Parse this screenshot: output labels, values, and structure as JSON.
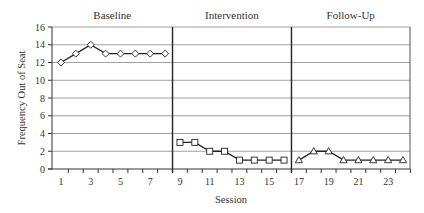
{
  "chart_data": {
    "type": "line",
    "title": "",
    "xlabel": "Session",
    "ylabel": "Frequency Out of Seat",
    "ylim": [
      0,
      16
    ],
    "yticks": [
      0,
      2,
      4,
      6,
      8,
      10,
      12,
      14,
      16
    ],
    "xlim": [
      1,
      24
    ],
    "xtick_labels": [
      1,
      3,
      5,
      7,
      9,
      11,
      13,
      15,
      17,
      19,
      21,
      23
    ],
    "grid": "horizontal",
    "legend": "none",
    "phase_change_lines": [
      8.5,
      16.5
    ],
    "phases": [
      {
        "name": "Baseline",
        "marker": "diamond",
        "x": [
          1,
          2,
          3,
          4,
          5,
          6,
          7,
          8
        ],
        "values": [
          12,
          13,
          14,
          13,
          13,
          13,
          13,
          13
        ]
      },
      {
        "name": "Intervention",
        "marker": "square",
        "x": [
          9,
          10,
          11,
          12,
          13,
          14,
          15,
          16
        ],
        "values": [
          3,
          3,
          2,
          2,
          1,
          1,
          1,
          1
        ]
      },
      {
        "name": "Follow-Up",
        "marker": "triangle",
        "x": [
          17,
          18,
          19,
          20,
          21,
          22,
          23,
          24
        ],
        "values": [
          1,
          2,
          2,
          1,
          1,
          1,
          1,
          1
        ]
      }
    ],
    "colors": {
      "line": "#222222",
      "grid": "#a0a0a0",
      "phase_line": "#222222",
      "marker_fill": "#ffffff"
    }
  }
}
